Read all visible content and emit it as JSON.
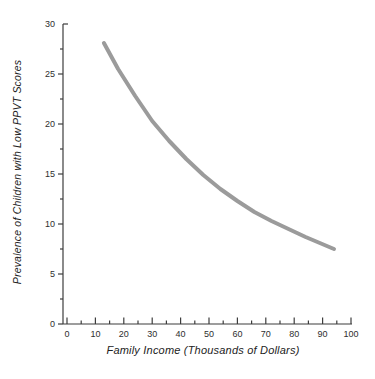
{
  "figure": {
    "background_color": "#ffffff"
  },
  "chart_data": {
    "type": "line",
    "title": "",
    "xlabel": "Family Income (Thousands of Dollars)",
    "ylabel": "Prevalence of Children with Low PPVT Scores",
    "xlim": [
      0,
      100
    ],
    "ylim": [
      0,
      30
    ],
    "x_major_ticks": [
      0,
      10,
      20,
      30,
      40,
      50,
      60,
      70,
      80,
      90,
      100
    ],
    "x_minor_ticks": [
      5,
      15,
      25,
      35,
      45,
      55,
      65,
      75,
      85,
      95
    ],
    "y_major_ticks": [
      0,
      5,
      10,
      15,
      20,
      25,
      30
    ],
    "y_minor_ticks": [
      2.5,
      7.5,
      12.5,
      17.5,
      22.5,
      27.5
    ],
    "grid": false,
    "legend": null,
    "axis_color": "#3d3d3d",
    "tick_label_color": "#2e2e2e",
    "series": [
      {
        "name": "prevalence-vs-income-curve",
        "color": "#9b9b9b",
        "stroke_width": 4,
        "points": [
          [
            13,
            28.1
          ],
          [
            18,
            25.5
          ],
          [
            24,
            22.8
          ],
          [
            30,
            20.3
          ],
          [
            36,
            18.3
          ],
          [
            42,
            16.5
          ],
          [
            48,
            14.9
          ],
          [
            54,
            13.5
          ],
          [
            60,
            12.3
          ],
          [
            66,
            11.2
          ],
          [
            72,
            10.3
          ],
          [
            78,
            9.5
          ],
          [
            84,
            8.7
          ],
          [
            89,
            8.1
          ],
          [
            94,
            7.5
          ]
        ]
      }
    ]
  }
}
